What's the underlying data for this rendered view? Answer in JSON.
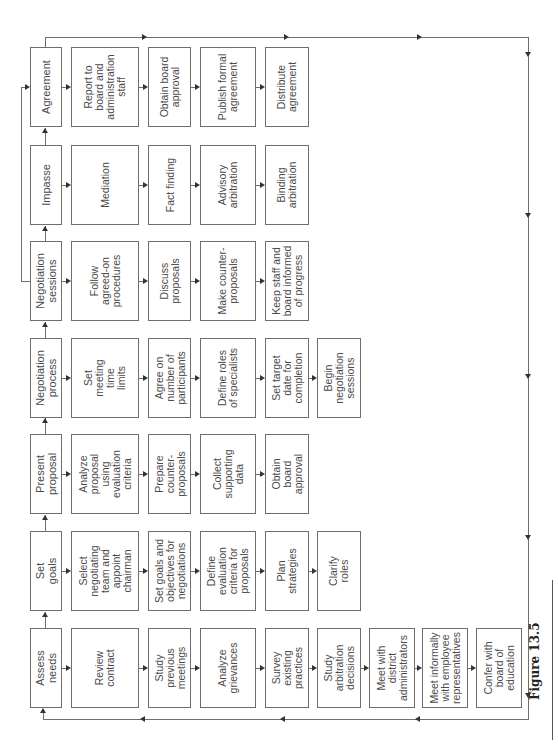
{
  "figure": {
    "caption": "Figure 13.5",
    "orientation": "rotated 90° counter-clockwise",
    "stages": [
      {
        "id": "agreement",
        "label": "Agreement",
        "steps": [
          "Report to\nboard and\nadministration\nstaff",
          "Obtain board\napproval",
          "Publish formal\nagreement",
          "Distribute\nagreement"
        ]
      },
      {
        "id": "impasse",
        "label": "Impasse",
        "steps": [
          "Mediation",
          "Fact finding",
          "Advisory\narbitration",
          "Binding\narbitration"
        ]
      },
      {
        "id": "negotiation-sessions",
        "label": "Negotiation\nsessions",
        "steps": [
          "Follow\nagreed-on\nprocedures",
          "Discuss\nproposals",
          "Make counter-\nproposals",
          "Keep staff and\nboard informed\nof progress"
        ]
      },
      {
        "id": "negotiation-process",
        "label": "Negotiation\nprocess",
        "steps": [
          "Set\nmeeting\ntime\nlimits",
          "Agree on\nnumber of\nparticipants",
          "Define roles\nof specialists",
          "Set target\ndate for\ncompletion",
          "Begin\nnegotiation\nsessions"
        ]
      },
      {
        "id": "present-proposal",
        "label": "Present\nproposal",
        "steps": [
          "Analyze\nproposal\nusing\nevaluation\ncriteria",
          "Prepare\ncounter-\nproposals",
          "Collect\nsupporting\ndata",
          "Obtain\nboard\napproval"
        ]
      },
      {
        "id": "set-goals",
        "label": "Set\ngoals",
        "steps": [
          "Select\nnegotiating\nteam and\nappoint\nchairman",
          "Set goals and\nobjectives for\nnegotiations",
          "Define\nevaluation\ncriteria for\nproposals",
          "Plan\nstrategies",
          "Clarify\nroles"
        ]
      },
      {
        "id": "assess-needs",
        "label": "Assess\nneeds",
        "steps": [
          "Review\ncontract",
          "Study\nprevious\nmeetings",
          "Analyze\ngrievances",
          "Survey\nexisting\npractices",
          "Study\narbitration\ndecisions",
          "Meet with\ndistrict\nadministrators",
          "Meet informally\nwith employee\nrepresentatives",
          "Confer with\nboard of\neducation"
        ]
      }
    ],
    "connections": [
      "Assess needs -> Set goals",
      "Set goals -> Present proposal",
      "Present proposal -> Negotiation process",
      "Negotiation process -> Negotiation sessions",
      "Negotiation sessions -> Impasse",
      "Impasse -> Agreement",
      "Negotiation sessions -> Agreement",
      "Agreement -> (loop) -> Assess needs"
    ],
    "colors": {
      "line": "#6e6e6e",
      "text": "#4a4a4a",
      "background": "#ffffff"
    }
  }
}
